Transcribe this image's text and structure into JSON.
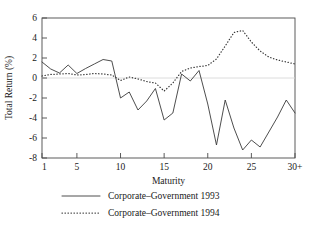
{
  "chart_data": {
    "type": "line",
    "title": "",
    "xlabel": "Maturity",
    "ylabel": "Total Return (%)",
    "xlim": [
      1,
      30
    ],
    "ylim": [
      -8,
      6
    ],
    "xticks": [
      1,
      5,
      10,
      15,
      20,
      25,
      30
    ],
    "xtick_labels": [
      "1",
      "5",
      "10",
      "15",
      "20",
      "25",
      "30+"
    ],
    "yticks": [
      -8,
      -6,
      -4,
      -2,
      0,
      2,
      4,
      6
    ],
    "ytick_labels": [
      "-8",
      "-6",
      "-4",
      "-2",
      "0",
      "2",
      "4",
      "6"
    ],
    "grid": false,
    "zero_line": true,
    "legend_position": "below",
    "line_color": "#3a3a3a",
    "frame_color": "#4a4a4a",
    "x": [
      1,
      2,
      3,
      4,
      5,
      6,
      7,
      8,
      9,
      10,
      11,
      12,
      13,
      14,
      15,
      16,
      17,
      18,
      19,
      20,
      21,
      22,
      23,
      24,
      25,
      26,
      27,
      28,
      29,
      30
    ],
    "series": [
      {
        "name": "Corporate–Government 1993",
        "style": "solid",
        "values": [
          1.6,
          0.9,
          0.5,
          1.3,
          0.45,
          0.95,
          1.4,
          1.85,
          1.7,
          -2.0,
          -1.4,
          -3.2,
          -2.3,
          -1.05,
          -4.2,
          -3.5,
          0.4,
          -0.3,
          0.75,
          -2.6,
          -6.7,
          -2.2,
          -5.0,
          -7.2,
          -6.2,
          -6.9,
          -5.4,
          -3.9,
          -2.2,
          -3.5
        ]
      },
      {
        "name": "Corporate–Government 1994",
        "style": "dotted",
        "values": [
          0.2,
          0.35,
          0.4,
          0.45,
          0.3,
          0.35,
          0.45,
          0.4,
          0.3,
          -0.25,
          0.1,
          -0.1,
          -0.35,
          -0.5,
          -1.3,
          -0.5,
          0.65,
          1.0,
          1.15,
          1.25,
          1.9,
          3.2,
          4.55,
          4.75,
          3.6,
          2.7,
          2.1,
          1.8,
          1.6,
          1.4
        ]
      }
    ]
  },
  "legend": {
    "items": [
      {
        "label": "Corporate–Government 1993",
        "style": "solid"
      },
      {
        "label": "Corporate–Government 1994",
        "style": "dotted"
      }
    ]
  }
}
